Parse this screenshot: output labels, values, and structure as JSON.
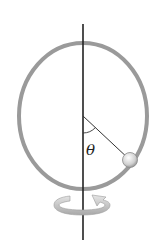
{
  "diagram": {
    "labels": {
      "angle": "θ"
    },
    "elements": [
      "vertical rotation axis",
      "circular hoop",
      "bead",
      "radius line",
      "angle arc",
      "rotation arrow"
    ],
    "colors": {
      "hoop": "#9a9a9a",
      "axis": "#222222",
      "bead": "#d8d8d8",
      "arrow": "#bdbdbd"
    }
  }
}
